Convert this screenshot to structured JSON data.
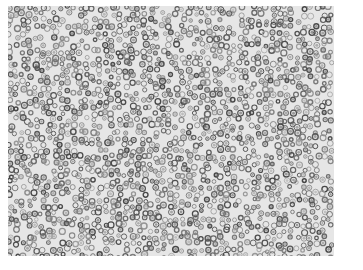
{
  "image": {
    "description": "Grayscale micrograph of densely packed small round cells with dark nuclei",
    "background_color": "#ffffff",
    "tissue_color": "#e6e6e6",
    "nucleus_color": "#6a6a6a",
    "nucleus_dark_color": "#3a3a3a"
  }
}
